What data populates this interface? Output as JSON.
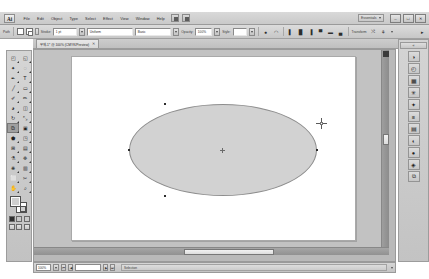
{
  "app": {
    "name": "Ai",
    "logo_label": "Ai"
  },
  "menubar": {
    "items": [
      {
        "label": "File"
      },
      {
        "label": "Edit"
      },
      {
        "label": "Object"
      },
      {
        "label": "Type"
      },
      {
        "label": "Select"
      },
      {
        "label": "Effect"
      },
      {
        "label": "View"
      },
      {
        "label": "Window"
      },
      {
        "label": "Help"
      }
    ],
    "bridge_button": "Br",
    "arrange_button": "Arrange Documents",
    "workspace": {
      "label": "Essentials",
      "caret": "chevron-down-icon"
    },
    "window_controls": {
      "minimize": "–",
      "maximize": "□",
      "close": "✕"
    }
  },
  "controlbar": {
    "selection_label": "Path",
    "fill_label": "Fill",
    "stroke_label": "Stroke:",
    "stroke_weight": "1 pt",
    "stroke_profile": "Uniform",
    "brush_definition": "Basic",
    "opacity_label": "Opacity:",
    "opacity_value": "100%",
    "style_label": "Style:",
    "transform_label": "Transform",
    "icons": [
      "isolate-selected-object-icon",
      "align-left-icon",
      "align-center-horizontal-icon",
      "align-right-icon",
      "align-top-icon",
      "align-center-vertical-icon",
      "align-bottom-icon"
    ],
    "transform_icons": [
      "shear-icon",
      "rotate-icon"
    ]
  },
  "tabbar": {
    "document": {
      "title": "무제-1* @ 100% (CMYK/Preview)",
      "close": "✕"
    }
  },
  "toolbar": {
    "tools": [
      {
        "name": "selection-tool",
        "glyph": "◰",
        "active": false
      },
      {
        "name": "direct-selection-tool",
        "glyph": "◱",
        "active": false
      },
      {
        "name": "magic-wand-tool",
        "glyph": "✦",
        "active": false
      },
      {
        "name": "lasso-tool",
        "glyph": "◌",
        "active": false
      },
      {
        "name": "pen-tool",
        "glyph": "✒",
        "active": false
      },
      {
        "name": "type-tool",
        "glyph": "T",
        "active": false
      },
      {
        "name": "line-segment-tool",
        "glyph": "╱",
        "active": false
      },
      {
        "name": "rectangle-tool",
        "glyph": "▭",
        "active": false
      },
      {
        "name": "paintbrush-tool",
        "glyph": "✐",
        "active": false
      },
      {
        "name": "pencil-tool",
        "glyph": "✏",
        "active": false
      },
      {
        "name": "blob-brush-tool",
        "glyph": "◕",
        "active": false
      },
      {
        "name": "eraser-tool",
        "glyph": "◫",
        "active": false
      },
      {
        "name": "rotate-tool",
        "glyph": "↻",
        "active": false
      },
      {
        "name": "scale-tool",
        "glyph": "⤡",
        "active": false
      },
      {
        "name": "width-tool",
        "glyph": "⧉",
        "active": true
      },
      {
        "name": "free-transform-tool",
        "glyph": "▣",
        "active": false
      },
      {
        "name": "shape-builder-tool",
        "glyph": "⬟",
        "active": false
      },
      {
        "name": "perspective-grid-tool",
        "glyph": "◳",
        "active": false
      },
      {
        "name": "mesh-tool",
        "glyph": "⊞",
        "active": false
      },
      {
        "name": "gradient-tool",
        "glyph": "▤",
        "active": false
      },
      {
        "name": "eyedropper-tool",
        "glyph": "⚗",
        "active": false
      },
      {
        "name": "blend-tool",
        "glyph": "❉",
        "active": false
      },
      {
        "name": "symbol-sprayer-tool",
        "glyph": "❋",
        "active": false
      },
      {
        "name": "column-graph-tool",
        "glyph": "▥",
        "active": false
      },
      {
        "name": "artboard-tool",
        "glyph": "⬜",
        "active": false
      },
      {
        "name": "slice-tool",
        "glyph": "✂",
        "active": false
      },
      {
        "name": "hand-tool",
        "glyph": "✋",
        "active": false
      },
      {
        "name": "zoom-tool",
        "glyph": "⌕",
        "active": false
      }
    ],
    "fill_color": "#cfcfcf",
    "stroke_color": "#ffffff",
    "color_modes": [
      "color-mode",
      "gradient-mode",
      "none-mode"
    ],
    "screen_modes": [
      "normal-screen-mode",
      "full-screen-menubar-mode",
      "full-screen-mode"
    ]
  },
  "canvas": {
    "artboard_background": "#ffffff",
    "canvas_background": "#c2c2c2",
    "shape": {
      "type": "ellipse",
      "fill": "#d2d2d2",
      "stroke": "#8d8d8d",
      "anchors": [
        "anchor-top",
        "anchor-right",
        "anchor-bottom",
        "anchor-left"
      ],
      "center": "center-point"
    },
    "cursor": "crosshair-cursor"
  },
  "statusbar": {
    "zoom_value": "100%",
    "first_page": "⏮",
    "prev_page": "◀",
    "next_page": "▶",
    "last_page": "⏭",
    "page_value": "1",
    "status_text": "Selection"
  },
  "dock": {
    "expand_label": "«",
    "panels": [
      {
        "name": "color-panel",
        "glyph": "◑"
      },
      {
        "name": "color-guide-panel",
        "glyph": "◴"
      },
      {
        "name": "swatches-panel",
        "glyph": "▦"
      },
      {
        "name": "brushes-panel",
        "glyph": "✳"
      },
      {
        "name": "symbols-panel",
        "glyph": "✦"
      },
      {
        "name": "stroke-panel",
        "glyph": "≡"
      },
      {
        "name": "gradient-panel",
        "glyph": "▤"
      },
      {
        "name": "transparency-panel",
        "glyph": "◐"
      },
      {
        "name": "appearance-panel",
        "glyph": "●"
      },
      {
        "name": "graphic-styles-panel",
        "glyph": "◈"
      },
      {
        "name": "layers-panel",
        "glyph": "⧉"
      }
    ]
  }
}
